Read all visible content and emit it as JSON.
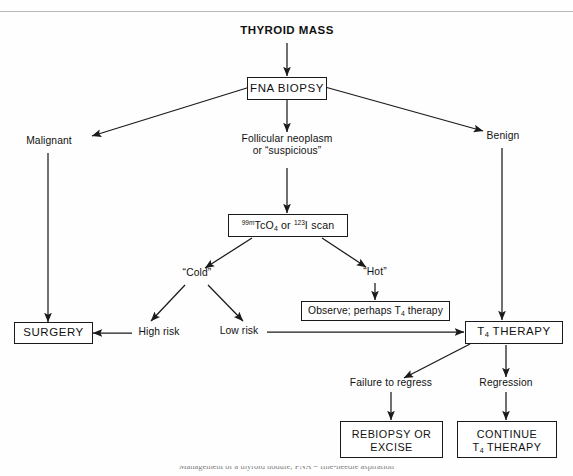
{
  "document": {
    "type": "clinical-decision-flowchart",
    "subject": "Thyroid mass management algorithm",
    "caption_partial": "Management of a thyroid nodule; FNA = fine-needle aspiration"
  },
  "nodes": {
    "thyroid_mass": {
      "label": "THYROID MASS",
      "shape": "plain"
    },
    "fna_biopsy": {
      "label": "FNA BIOPSY",
      "shape": "box"
    },
    "malignant": {
      "label": "Malignant",
      "shape": "plain"
    },
    "follicular": {
      "line1": "Follicular neoplasm",
      "line2": "or “suspicious”",
      "shape": "plain"
    },
    "benign": {
      "label": "Benign",
      "shape": "plain"
    },
    "scan": {
      "sup1": "99m",
      "elem1": "TcO",
      "sub1": "4",
      "conj": "or",
      "sup2": "123",
      "elem2": "I scan",
      "shape": "box"
    },
    "cold": {
      "label": "“Cold”",
      "shape": "plain"
    },
    "hot": {
      "label": "“Hot”",
      "shape": "plain"
    },
    "observe": {
      "pre": "Observe; perhaps T",
      "sub": "4",
      "post": " therapy",
      "shape": "box"
    },
    "high_risk": {
      "label": "High risk",
      "shape": "plain"
    },
    "low_risk": {
      "label": "Low risk",
      "shape": "plain"
    },
    "surgery": {
      "label": "SURGERY",
      "shape": "box"
    },
    "t4_therapy": {
      "pre": "T",
      "sub": "4",
      "post": " THERAPY",
      "shape": "box"
    },
    "failure": {
      "label": "Failure to regress",
      "shape": "plain"
    },
    "regression": {
      "label": "Regression",
      "shape": "plain"
    },
    "rebiopsy": {
      "line1": "REBIOPSY OR",
      "line2": "EXCISE",
      "shape": "box"
    },
    "continue_t4": {
      "line1": "CONTINUE",
      "pre": "T",
      "sub": "4",
      "post": " THERAPY",
      "shape": "box"
    }
  },
  "edges": [
    {
      "from": "thyroid_mass",
      "to": "fna_biopsy"
    },
    {
      "from": "fna_biopsy",
      "to": "malignant"
    },
    {
      "from": "fna_biopsy",
      "to": "follicular"
    },
    {
      "from": "fna_biopsy",
      "to": "benign"
    },
    {
      "from": "malignant",
      "to": "surgery"
    },
    {
      "from": "follicular",
      "to": "scan"
    },
    {
      "from": "scan",
      "to": "cold"
    },
    {
      "from": "scan",
      "to": "hot"
    },
    {
      "from": "cold",
      "to": "high_risk"
    },
    {
      "from": "cold",
      "to": "low_risk"
    },
    {
      "from": "hot",
      "to": "observe"
    },
    {
      "from": "high_risk",
      "to": "surgery"
    },
    {
      "from": "low_risk",
      "to": "t4_therapy"
    },
    {
      "from": "benign",
      "to": "t4_therapy"
    },
    {
      "from": "t4_therapy",
      "to": "failure"
    },
    {
      "from": "t4_therapy",
      "to": "regression"
    },
    {
      "from": "failure",
      "to": "rebiopsy"
    },
    {
      "from": "regression",
      "to": "continue_t4"
    }
  ],
  "colors": {
    "ink": "#111111",
    "stroke": "#1a1a1a",
    "paper": "#fefefe",
    "rule": "#b8b8b8"
  }
}
